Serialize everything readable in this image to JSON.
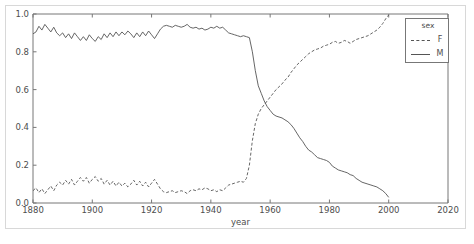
{
  "chart_data": {
    "type": "line",
    "title": "",
    "xlabel": "year",
    "ylabel": "",
    "xlim": [
      1880,
      2020
    ],
    "ylim": [
      0.0,
      1.0
    ],
    "grid": false,
    "legend": {
      "title": "sex",
      "position": "upper right",
      "entries": [
        {
          "name": "F",
          "style": "dashed"
        },
        {
          "name": "M",
          "style": "solid"
        }
      ]
    },
    "xticks": [
      1880,
      1900,
      1920,
      1940,
      1960,
      1980,
      2000,
      2020
    ],
    "xtick_labels": [
      "1880",
      "1900",
      "1920",
      "1940",
      "1960",
      "1980",
      "2000",
      "2020"
    ],
    "yticks": [
      0.0,
      0.2,
      0.4,
      0.6,
      0.8,
      1.0
    ],
    "ytick_labels": [
      "0.0",
      "0.2",
      "0.4",
      "0.6",
      "0.8",
      "1.0"
    ],
    "colors": {
      "line": "#555555",
      "axis": "#777777",
      "text": "#4d4d4d",
      "frame": "#d8d8d8"
    },
    "x": [
      1880,
      1881,
      1882,
      1883,
      1884,
      1885,
      1886,
      1887,
      1888,
      1889,
      1890,
      1891,
      1892,
      1893,
      1894,
      1895,
      1896,
      1897,
      1898,
      1899,
      1900,
      1901,
      1902,
      1903,
      1904,
      1905,
      1906,
      1907,
      1908,
      1909,
      1910,
      1911,
      1912,
      1913,
      1914,
      1915,
      1916,
      1917,
      1918,
      1919,
      1920,
      1921,
      1922,
      1923,
      1924,
      1925,
      1926,
      1927,
      1928,
      1929,
      1930,
      1931,
      1932,
      1933,
      1934,
      1935,
      1936,
      1937,
      1938,
      1939,
      1940,
      1941,
      1942,
      1943,
      1944,
      1945,
      1946,
      1947,
      1948,
      1949,
      1950,
      1951,
      1952,
      1953,
      1954,
      1955,
      1956,
      1957,
      1958,
      1959,
      1960,
      1961,
      1962,
      1963,
      1964,
      1965,
      1966,
      1967,
      1968,
      1969,
      1970,
      1971,
      1972,
      1973,
      1974,
      1975,
      1976,
      1977,
      1978,
      1979,
      1980,
      1981,
      1982,
      1983,
      1984,
      1985,
      1986,
      1987,
      1988,
      1989,
      1990,
      1991,
      1992,
      1993,
      1994,
      1995,
      1996,
      1997,
      1998,
      1999,
      2000
    ],
    "series": [
      {
        "name": "M",
        "style": "solid",
        "values": [
          0.895,
          0.905,
          0.935,
          0.915,
          0.945,
          0.925,
          0.905,
          0.93,
          0.9,
          0.885,
          0.9,
          0.875,
          0.895,
          0.87,
          0.9,
          0.88,
          0.86,
          0.88,
          0.86,
          0.89,
          0.87,
          0.855,
          0.88,
          0.865,
          0.895,
          0.875,
          0.9,
          0.88,
          0.905,
          0.885,
          0.905,
          0.89,
          0.91,
          0.895,
          0.875,
          0.9,
          0.88,
          0.905,
          0.885,
          0.91,
          0.89,
          0.87,
          0.895,
          0.92,
          0.935,
          0.94,
          0.935,
          0.93,
          0.94,
          0.935,
          0.93,
          0.935,
          0.945,
          0.93,
          0.925,
          0.93,
          0.92,
          0.925,
          0.915,
          0.92,
          0.93,
          0.925,
          0.935,
          0.925,
          0.93,
          0.915,
          0.9,
          0.895,
          0.89,
          0.885,
          0.88,
          0.885,
          0.88,
          0.875,
          0.8,
          0.7,
          0.62,
          0.58,
          0.54,
          0.51,
          0.49,
          0.47,
          0.46,
          0.455,
          0.45,
          0.44,
          0.43,
          0.415,
          0.395,
          0.37,
          0.345,
          0.325,
          0.3,
          0.28,
          0.27,
          0.255,
          0.24,
          0.235,
          0.23,
          0.225,
          0.215,
          0.195,
          0.185,
          0.175,
          0.17,
          0.165,
          0.16,
          0.15,
          0.145,
          0.13,
          0.12,
          0.11,
          0.105,
          0.1,
          0.095,
          0.09,
          0.085,
          0.075,
          0.065,
          0.05,
          0.03
        ]
      },
      {
        "name": "F",
        "style": "dashed",
        "values": [
          0.065,
          0.08,
          0.055,
          0.075,
          0.05,
          0.07,
          0.09,
          0.065,
          0.095,
          0.11,
          0.095,
          0.12,
          0.1,
          0.125,
          0.095,
          0.115,
          0.135,
          0.115,
          0.135,
          0.105,
          0.125,
          0.14,
          0.115,
          0.13,
          0.1,
          0.12,
          0.095,
          0.115,
          0.09,
          0.11,
          0.09,
          0.105,
          0.085,
          0.1,
          0.12,
          0.095,
          0.115,
          0.09,
          0.11,
          0.085,
          0.105,
          0.125,
          0.1,
          0.075,
          0.06,
          0.055,
          0.06,
          0.065,
          0.055,
          0.06,
          0.065,
          0.06,
          0.05,
          0.065,
          0.07,
          0.065,
          0.075,
          0.07,
          0.08,
          0.075,
          0.065,
          0.07,
          0.06,
          0.07,
          0.065,
          0.08,
          0.095,
          0.1,
          0.105,
          0.11,
          0.115,
          0.11,
          0.13,
          0.2,
          0.33,
          0.42,
          0.47,
          0.5,
          0.52,
          0.54,
          0.56,
          0.58,
          0.6,
          0.615,
          0.63,
          0.65,
          0.665,
          0.69,
          0.71,
          0.73,
          0.745,
          0.76,
          0.775,
          0.79,
          0.8,
          0.81,
          0.815,
          0.82,
          0.83,
          0.835,
          0.84,
          0.85,
          0.855,
          0.845,
          0.85,
          0.86,
          0.855,
          0.845,
          0.855,
          0.865,
          0.87,
          0.875,
          0.88,
          0.885,
          0.895,
          0.905,
          0.915,
          0.93,
          0.95,
          0.975,
          0.995
        ]
      }
    ]
  }
}
